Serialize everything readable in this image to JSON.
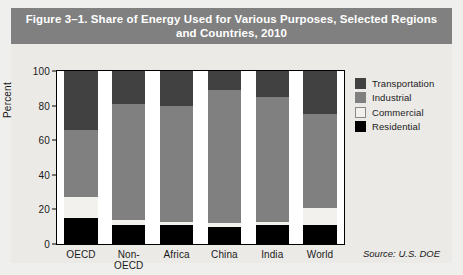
{
  "figure": {
    "title": "Figure 3–1. Share of Energy Used for Various Purposes, Selected Regions and Countries, 2010",
    "source": "Source: U.S. DOE"
  },
  "colors": {
    "title_bar": "#808080",
    "panel_bg": "#eceae7",
    "transportation": "#414141",
    "industrial": "#808080",
    "commercial": "#f2f1ee",
    "residential": "#000000"
  },
  "chart_data": {
    "type": "bar",
    "stacked": true,
    "title": "Figure 3–1. Share of Energy Used for Various Purposes, Selected Regions and Countries, 2010",
    "xlabel": "",
    "ylabel": "Percent",
    "ylim": [
      0,
      100
    ],
    "yticks": [
      0,
      20,
      40,
      60,
      80,
      100
    ],
    "ytick_labels": [
      "0",
      "20",
      "40",
      "60",
      "80",
      "100"
    ],
    "grid": false,
    "legend_position": "right",
    "categories": [
      "OECD",
      "Non-OECD",
      "Africa",
      "China",
      "India",
      "World"
    ],
    "series": [
      {
        "name": "Residential",
        "color": "#000000",
        "values": [
          15,
          11,
          11,
          10,
          11,
          11
        ]
      },
      {
        "name": "Commercial",
        "color": "#f2f1ee",
        "values": [
          12,
          3,
          2,
          2,
          2,
          10
        ]
      },
      {
        "name": "Industrial",
        "color": "#808080",
        "values": [
          39,
          67,
          67,
          77,
          72,
          54
        ]
      },
      {
        "name": "Transportation",
        "color": "#414141",
        "values": [
          34,
          19,
          20,
          11,
          15,
          25
        ]
      }
    ],
    "legend_order": [
      "Transportation",
      "Industrial",
      "Commercial",
      "Residential"
    ],
    "annotations": [
      "Source: U.S. DOE"
    ]
  }
}
